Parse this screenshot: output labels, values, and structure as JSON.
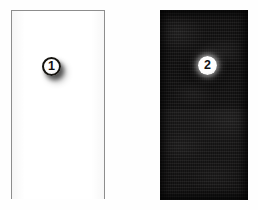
{
  "figure": {
    "background_color": "#fefefe",
    "panels": [
      {
        "id": "panel-1",
        "marker_label": "1",
        "appearance": "light",
        "fill_color": "#ffffff",
        "border_color": "#8d8d8d",
        "texture": "plain",
        "marker_style": "white disc with dark outline and drop shadow"
      },
      {
        "id": "panel-2",
        "marker_label": "2",
        "appearance": "dark",
        "fill_color": "#100f0f",
        "border_color": "#100f0f",
        "texture": "mottled horizontal striations",
        "marker_style": "white disc with soft white halo"
      }
    ]
  }
}
